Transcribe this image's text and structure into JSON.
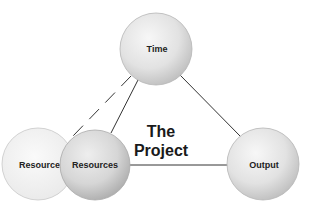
{
  "diagram": {
    "center_label": {
      "line1": "The",
      "line2": "Project"
    },
    "nodes": [
      {
        "id": "time",
        "label": "Time",
        "cx": 156,
        "cy": 49,
        "r": 36,
        "style": "solid"
      },
      {
        "id": "resources-ghost",
        "label": "Resources",
        "cx": 38,
        "cy": 164,
        "r": 36,
        "style": "ghost"
      },
      {
        "id": "resources",
        "label": "Resources",
        "cx": 95,
        "cy": 165,
        "r": 35,
        "style": "solid"
      },
      {
        "id": "output",
        "label": "Output",
        "cx": 263,
        "cy": 164,
        "r": 36,
        "style": "solid"
      }
    ],
    "edges": [
      {
        "from": "time",
        "to": "resources",
        "style": "solid"
      },
      {
        "from": "time",
        "to": "output",
        "style": "solid"
      },
      {
        "from": "resources",
        "to": "output",
        "style": "solid"
      },
      {
        "from": "time",
        "to": "resources-ghost",
        "style": "dashed"
      }
    ],
    "colors": {
      "line": "#333333",
      "node_fill_light": "#f4f4f4",
      "node_fill_dark": "#c9c9c9",
      "ghost_fill": "#f2f2f2",
      "node_stroke": "#b5b5b5"
    }
  }
}
